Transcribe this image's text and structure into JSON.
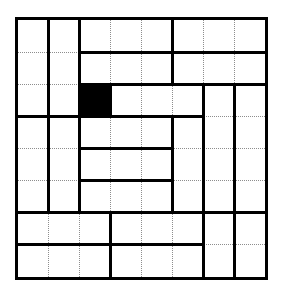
{
  "figure": {
    "name": "grid-dissection-puzzle",
    "type": "rectangle-dissection",
    "caption": "",
    "background_color": "#ffffff",
    "line_color": "#000000",
    "guide_color": "#8d8d8d",
    "fill_color": "#000000"
  },
  "geometry": {
    "origin_x": 18,
    "origin_y": 20,
    "cell_width": 30.9,
    "cell_height": 32.1,
    "columns": 8,
    "rows": 8,
    "border_width": 3,
    "interior_width": 3,
    "guide_width": 1
  },
  "grid": {
    "label": "8 by 8 unit grid",
    "column_count": 8,
    "row_count": 8,
    "guide_style": "dotted"
  },
  "filled_cells": [
    {
      "name": "black-square",
      "col": 2,
      "row": 2,
      "w": 1,
      "h": 1
    }
  ],
  "regions": [
    {
      "name": "region-r1c1",
      "col": 0,
      "row": 0,
      "w": 1,
      "h": 4
    },
    {
      "name": "region-r1c2",
      "col": 1,
      "row": 0,
      "w": 1,
      "h": 4
    },
    {
      "name": "region-top-mid-a",
      "col": 2,
      "row": 0,
      "w": 3,
      "h": 1
    },
    {
      "name": "region-top-right-a",
      "col": 5,
      "row": 0,
      "w": 3,
      "h": 2
    },
    {
      "name": "region-top-mid-b",
      "col": 2,
      "row": 1,
      "w": 3,
      "h": 1
    },
    {
      "name": "region-black",
      "col": 2,
      "row": 2,
      "w": 1,
      "h": 1
    },
    {
      "name": "region-mid-bar",
      "col": 3,
      "row": 2,
      "w": 3,
      "h": 1
    },
    {
      "name": "region-right-tall-a",
      "col": 6,
      "row": 2,
      "w": 1,
      "h": 4
    },
    {
      "name": "region-right-tall-b",
      "col": 7,
      "row": 2,
      "w": 1,
      "h": 4
    },
    {
      "name": "region-mid-c",
      "col": 2,
      "row": 3,
      "w": 3,
      "h": 1
    },
    {
      "name": "region-mid-d",
      "col": 2,
      "row": 4,
      "w": 3,
      "h": 1
    },
    {
      "name": "region-mid-e",
      "col": 2,
      "row": 5,
      "w": 3,
      "h": 1
    },
    {
      "name": "region-mid-col",
      "col": 5,
      "row": 3,
      "w": 1,
      "h": 3
    },
    {
      "name": "region-left-lower-a",
      "col": 0,
      "row": 4,
      "w": 1,
      "h": 2
    },
    {
      "name": "region-left-lower-b",
      "col": 1,
      "row": 4,
      "w": 1,
      "h": 2
    },
    {
      "name": "region-bottom-left-a",
      "col": 0,
      "row": 6,
      "w": 3,
      "h": 1
    },
    {
      "name": "region-bottom-left-b",
      "col": 0,
      "row": 7,
      "w": 3,
      "h": 1
    },
    {
      "name": "region-bottom-mid-a",
      "col": 3,
      "row": 6,
      "w": 3,
      "h": 1
    },
    {
      "name": "region-bottom-mid-b",
      "col": 3,
      "row": 7,
      "w": 3,
      "h": 1
    },
    {
      "name": "region-bottom-right-a",
      "col": 6,
      "row": 6,
      "w": 1,
      "h": 2
    },
    {
      "name": "region-bottom-right-b",
      "col": 7,
      "row": 6,
      "w": 1,
      "h": 2
    }
  ],
  "bold_horizontal_segments": [
    {
      "name": "hseg-r1-mid",
      "row": 1,
      "col_start": 2,
      "col_end": 8
    },
    {
      "name": "hseg-r2-left",
      "row": 2,
      "col_start": 2,
      "col_end": 5
    },
    {
      "name": "hseg-r2-right",
      "row": 2,
      "col_start": 5,
      "col_end": 8
    },
    {
      "name": "hseg-r3-left",
      "row": 3,
      "col_start": 0,
      "col_end": 2
    },
    {
      "name": "hseg-r3-mid",
      "row": 3,
      "col_start": 2,
      "col_end": 6
    },
    {
      "name": "hseg-r4-mid",
      "row": 4,
      "col_start": 2,
      "col_end": 5
    },
    {
      "name": "hseg-r5-mid",
      "row": 5,
      "col_start": 2,
      "col_end": 5
    },
    {
      "name": "hseg-r6-left",
      "row": 6,
      "col_start": 0,
      "col_end": 6
    },
    {
      "name": "hseg-r6-right",
      "row": 6,
      "col_start": 6,
      "col_end": 8
    },
    {
      "name": "hseg-r7-left",
      "row": 7,
      "col_start": 0,
      "col_end": 3
    },
    {
      "name": "hseg-r7-mid",
      "row": 7,
      "col_start": 3,
      "col_end": 6
    }
  ],
  "bold_vertical_segments": [
    {
      "name": "vseg-c1-top",
      "col": 1,
      "row_start": 0,
      "row_end": 3
    },
    {
      "name": "vseg-c1-lower",
      "col": 1,
      "row_start": 3,
      "row_end": 6
    },
    {
      "name": "vseg-c2-top",
      "col": 2,
      "row_start": 0,
      "row_end": 3
    },
    {
      "name": "vseg-c2-lower",
      "col": 2,
      "row_start": 3,
      "row_end": 6
    },
    {
      "name": "vseg-c3-black",
      "col": 3,
      "row_start": 2,
      "row_end": 3
    },
    {
      "name": "vseg-c5-top",
      "col": 5,
      "row_start": 0,
      "row_end": 2
    },
    {
      "name": "vseg-c5-lower",
      "col": 5,
      "row_start": 3,
      "row_end": 6
    },
    {
      "name": "vseg-c6-mid",
      "col": 6,
      "row_start": 2,
      "row_end": 6
    },
    {
      "name": "vseg-c6-bottom",
      "col": 6,
      "row_start": 6,
      "row_end": 8
    },
    {
      "name": "vseg-c7-mid",
      "col": 7,
      "row_start": 2,
      "row_end": 6
    },
    {
      "name": "vseg-c7-bottom",
      "col": 7,
      "row_start": 6,
      "row_end": 8
    },
    {
      "name": "vseg-c3-bottom",
      "col": 3,
      "row_start": 6,
      "row_end": 8
    }
  ]
}
